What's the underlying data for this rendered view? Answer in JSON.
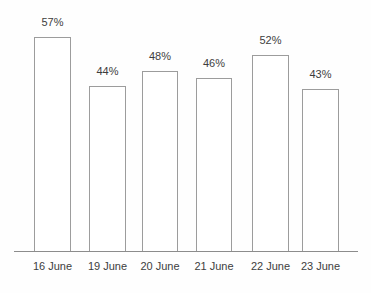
{
  "chart_data": {
    "type": "bar",
    "categories": [
      "16 June",
      "19 June",
      "20 June",
      "21 June",
      "22 June",
      "23 June"
    ],
    "values": [
      57,
      44,
      48,
      46,
      52,
      43
    ],
    "value_labels": [
      "57%",
      "44%",
      "48%",
      "46%",
      "52%",
      "43%"
    ],
    "title": "",
    "xlabel": "",
    "ylabel": "",
    "ylim": [
      0,
      67
    ],
    "grid": false,
    "legend_position": "none",
    "colors": {
      "bar_fill": "#ffffff",
      "bar_border": "#9c9c9c",
      "axis": "#8c8c8c",
      "text": "#3d3d3d"
    }
  }
}
